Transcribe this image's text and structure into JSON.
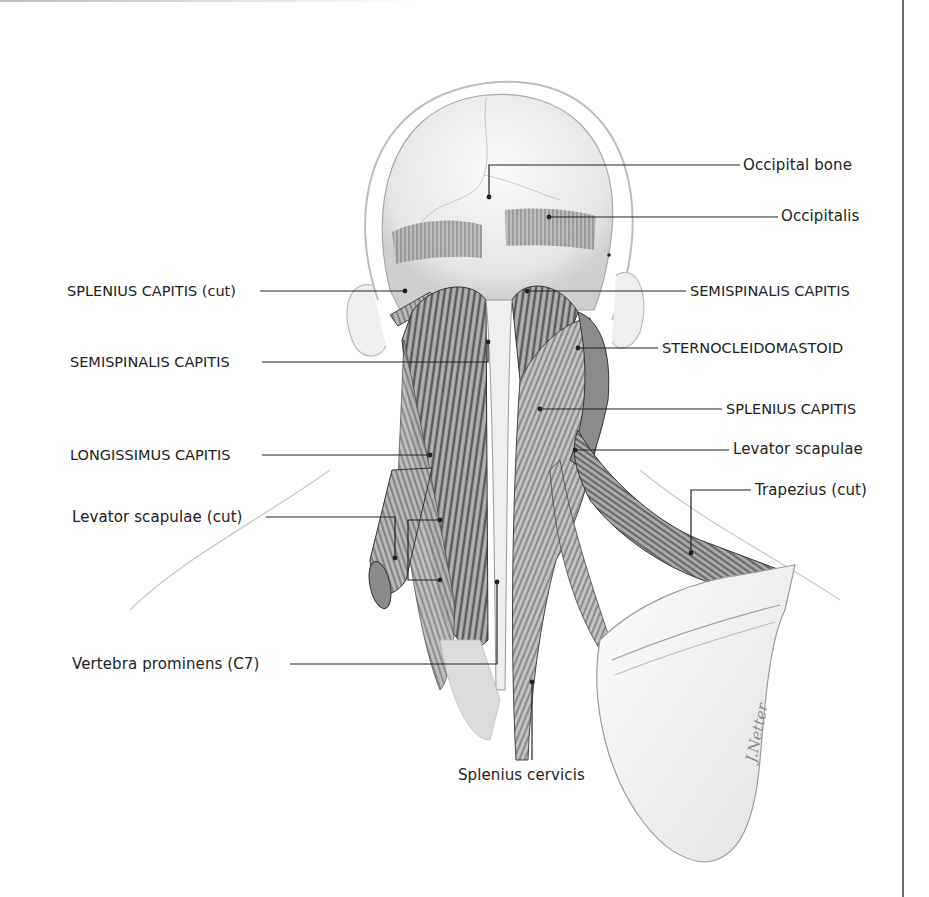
{
  "figure": {
    "colors": {
      "ink": "#222222",
      "muscle_dark": "#4a4a4a",
      "muscle_mid": "#8c8c8c",
      "bone": "#f1f1f1",
      "outline": "#9a9a9a",
      "border": "#6e6e6e"
    },
    "labels_left": [
      {
        "id": "splenius-capitis-cut",
        "text": "SPLENIUS CAPITIS (cut)",
        "caps": true,
        "x": 67,
        "y": 282
      },
      {
        "id": "semispinalis-capitis-left",
        "text": "SEMISPINALIS CAPITIS",
        "caps": true,
        "x": 70,
        "y": 357
      },
      {
        "id": "longissimus-capitis",
        "text": "LONGISSIMUS CAPITIS",
        "caps": true,
        "x": 70,
        "y": 448
      },
      {
        "id": "levator-scapulae-cut",
        "text": "Levator scapulae (cut)",
        "caps": false,
        "x": 72,
        "y": 509
      },
      {
        "id": "vertebra-prominens",
        "text": "Vertebra prominens (C7)",
        "caps": false,
        "x": 72,
        "y": 655
      }
    ],
    "labels_right": [
      {
        "id": "occipital-bone",
        "text": "Occipital bone",
        "caps": false,
        "x": 743,
        "y": 156
      },
      {
        "id": "occipitalis",
        "text": "Occipitalis",
        "caps": false,
        "x": 781,
        "y": 206
      },
      {
        "id": "semispinalis-capitis-right",
        "text": "SEMISPINALIS CAPITIS",
        "caps": true,
        "x": 690,
        "y": 282
      },
      {
        "id": "sternocleidomastoid",
        "text": "STERNOCLEIDOMASTOID",
        "caps": true,
        "x": 662,
        "y": 341
      },
      {
        "id": "splenius-capitis",
        "text": "SPLENIUS CAPITIS",
        "caps": true,
        "x": 726,
        "y": 400
      },
      {
        "id": "levator-scapulae",
        "text": "Levator scapulae",
        "caps": false,
        "x": 733,
        "y": 440
      },
      {
        "id": "trapezius-cut",
        "text": "Trapezius (cut)",
        "caps": false,
        "x": 755,
        "y": 481
      }
    ],
    "labels_bottom": [
      {
        "id": "splenius-cervicis",
        "text": "Splenius cervicis",
        "caps": false,
        "x": 458,
        "y": 766
      }
    ],
    "signature": "JHNetter-style signature"
  }
}
